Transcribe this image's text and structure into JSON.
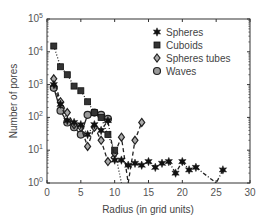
{
  "chart_data": {
    "type": "line",
    "title": "",
    "xlabel": "Radius (in grid units)",
    "ylabel": "Number of pores",
    "xlim": [
      0,
      30
    ],
    "ylim": [
      1,
      100000
    ],
    "yscale": "log",
    "xticks": [
      0,
      5,
      10,
      15,
      20,
      25,
      30
    ],
    "yticks": [
      "10^0",
      "10^1",
      "10^2",
      "10^3",
      "10^4",
      "10^5"
    ],
    "grid": false,
    "legend_position": "upper right",
    "series": [
      {
        "name": "Spheres",
        "marker": "star",
        "linestyle": "dash-dot",
        "x": [
          1,
          2,
          3,
          4,
          5,
          6,
          7,
          8,
          9,
          10,
          11,
          12,
          13,
          14,
          15,
          16,
          17,
          18,
          19,
          20,
          21,
          22,
          25,
          26
        ],
        "y": [
          1000,
          250,
          80,
          70,
          60,
          30,
          60,
          40,
          80,
          5,
          5,
          3.5,
          4,
          3.5,
          4.5,
          3,
          4,
          4.5,
          2,
          4.5,
          2.5,
          3,
          1,
          2.5
        ]
      },
      {
        "name": "Cuboids",
        "marker": "square",
        "linestyle": "dotted",
        "x": [
          1,
          2,
          3,
          4,
          5,
          6,
          7,
          8,
          9,
          10,
          11
        ],
        "y": [
          15000,
          3500,
          2000,
          900,
          650,
          300,
          140,
          100,
          30,
          10,
          1
        ]
      },
      {
        "name": "Spheres tubes",
        "marker": "diamond",
        "linestyle": "dashed",
        "x": [
          1,
          2,
          3,
          4,
          5,
          6,
          7,
          8,
          9,
          10,
          11,
          12,
          13,
          14
        ],
        "y": [
          1500,
          300,
          140,
          60,
          50,
          13,
          50,
          20,
          4.5,
          8,
          25,
          1,
          20,
          70
        ]
      },
      {
        "name": "Waves",
        "marker": "circle",
        "linestyle": "solid",
        "x": [
          1,
          2,
          3,
          4,
          5,
          6,
          7,
          8,
          9
        ],
        "y": [
          800,
          160,
          70,
          50,
          30,
          120,
          140,
          120,
          90
        ]
      }
    ]
  }
}
